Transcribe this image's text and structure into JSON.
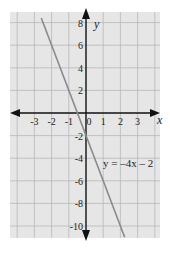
{
  "chart_data": {
    "type": "line",
    "title": "",
    "xlabel": "x",
    "ylabel": "y",
    "xlim": [
      -4.4,
      4.4
    ],
    "ylim": [
      -11,
      9
    ],
    "grid": true,
    "x_ticks": [
      -3,
      -2,
      -1,
      0,
      1,
      2,
      3
    ],
    "x_tick_labels": [
      "-3",
      "-2",
      "-1",
      "0",
      "1",
      "2",
      "3"
    ],
    "y_ticks": [
      8,
      6,
      4,
      2,
      -2,
      -4,
      -6,
      -8,
      -10
    ],
    "y_tick_labels": [
      "8",
      "6",
      "4",
      "2",
      "-2",
      "-4",
      "-6",
      "-8",
      "-10"
    ],
    "series": [
      {
        "name": "y = -4x - 2",
        "equation": "y = -4x - 2",
        "slope": -4,
        "intercept": -2,
        "x": [
          -2.6,
          2.25
        ],
        "y": [
          8.4,
          -11
        ],
        "color": "#8a8a8a"
      }
    ],
    "annotations": [
      {
        "text": "y = –4x – 2",
        "x": 1.3,
        "y": -4.6
      }
    ]
  },
  "colors": {
    "background": "#e6e6e6",
    "grid": "#b8b8b8",
    "axis": "#111111",
    "line": "#8a8a8a"
  },
  "labels": {
    "x_axis": "x",
    "y_axis": "y",
    "equation": "y = –4x – 2"
  }
}
